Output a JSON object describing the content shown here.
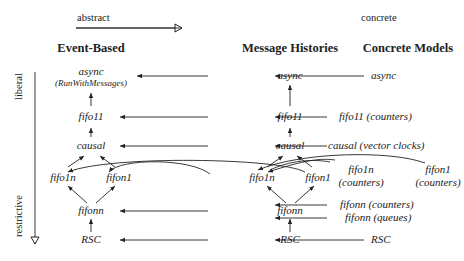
{
  "axes": {
    "horizontal": {
      "start": "abstract",
      "end": "concrete"
    },
    "vertical": {
      "start": "liberal",
      "end": "restrictive"
    }
  },
  "columns": [
    {
      "id": "event",
      "label": "Event-Based"
    },
    {
      "id": "history",
      "label": "Message Histories"
    },
    {
      "id": "concrete",
      "label": "Concrete Models"
    }
  ],
  "nodes": {
    "event": {
      "async": "async",
      "async_sub": "(RunWithMessages)",
      "fifo11": "fifo11",
      "causal": "causal",
      "fifo1n": "fifo1n",
      "fifon1": "fifon1",
      "fifonn": "fifonn",
      "rsc": "RSC"
    },
    "history": {
      "async": "async",
      "fifo11": "fifo11",
      "causal": "causal",
      "fifo1n": "fifo1n",
      "fifon1": "fifon1",
      "fifonn": "fifonn",
      "rsc": "RSC"
    },
    "concrete": {
      "async": "async",
      "fifo11": "fifo11 (counters)",
      "causal": "causal (vector clocks)",
      "fifo1n_line1": "fifo1n",
      "fifo1n_line2": "(counters)",
      "fifon1_line1": "fifon1",
      "fifon1_line2": "(counters)",
      "fifonn_counters": "fifonn (counters)",
      "fifonn_queues": "fifonn (queues)",
      "rsc": "RSC"
    }
  },
  "edges": [
    {
      "from": "event.fifo11",
      "to": "event.async"
    },
    {
      "from": "event.causal",
      "to": "event.fifo11"
    },
    {
      "from": "event.fifo1n",
      "to": "event.causal"
    },
    {
      "from": "event.fifon1",
      "to": "event.causal"
    },
    {
      "from": "event.fifonn",
      "to": "event.fifo1n"
    },
    {
      "from": "event.fifonn",
      "to": "event.fifon1"
    },
    {
      "from": "event.rsc",
      "to": "event.fifonn"
    },
    {
      "from": "history.fifo11",
      "to": "history.async"
    },
    {
      "from": "history.causal",
      "to": "history.fifo11"
    },
    {
      "from": "history.fifo1n",
      "to": "history.causal"
    },
    {
      "from": "history.fifon1",
      "to": "history.causal"
    },
    {
      "from": "history.fifonn",
      "to": "history.fifo1n"
    },
    {
      "from": "history.fifonn",
      "to": "history.fifon1"
    },
    {
      "from": "history.rsc",
      "to": "history.fifonn"
    },
    {
      "from": "history.async",
      "to": "event.async"
    },
    {
      "from": "history.fifo11",
      "to": "event.fifo11"
    },
    {
      "from": "history.causal",
      "to": "event.causal"
    },
    {
      "from": "history.fifo1n",
      "to": "event.fifo1n"
    },
    {
      "from": "history.fifon1",
      "to": "event.fifon1"
    },
    {
      "from": "history.fifonn",
      "to": "event.fifonn"
    },
    {
      "from": "history.rsc",
      "to": "event.rsc"
    },
    {
      "from": "concrete.async",
      "to": "history.async"
    },
    {
      "from": "concrete.fifo11",
      "to": "history.fifo11"
    },
    {
      "from": "concrete.causal",
      "to": "history.causal"
    },
    {
      "from": "concrete.fifo1n",
      "to": "history.fifo1n"
    },
    {
      "from": "concrete.fifon1",
      "to": "history.fifon1"
    },
    {
      "from": "concrete.fifonn_counters",
      "to": "history.fifonn"
    },
    {
      "from": "concrete.fifonn_queues",
      "to": "history.fifonn"
    },
    {
      "from": "concrete.rsc",
      "to": "history.rsc"
    }
  ]
}
